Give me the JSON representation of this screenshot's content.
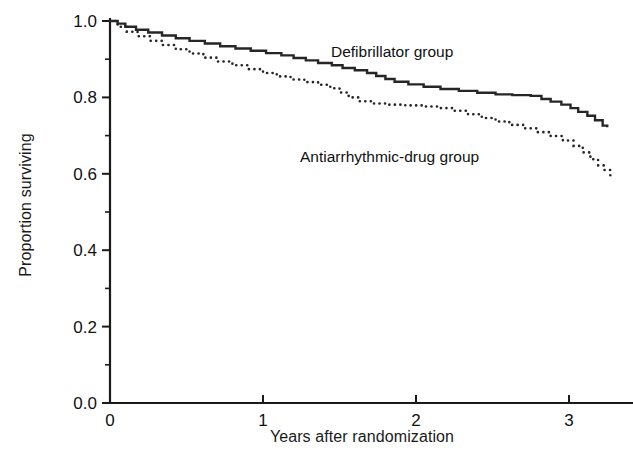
{
  "chart_data": {
    "type": "line",
    "title": "",
    "subtitle": "",
    "xlabel": "Years after randomization",
    "ylabel": "Proportion surviving",
    "xlim": [
      0,
      3.42
    ],
    "ylim": [
      0.0,
      1.0
    ],
    "xticks": [
      0,
      1,
      2,
      3
    ],
    "xticklabels": [
      "0",
      "1",
      "2",
      "3"
    ],
    "yticks": [
      0.0,
      0.2,
      0.4,
      0.6,
      0.8,
      1.0
    ],
    "yticklabels": [
      "0.0",
      "0.2",
      "0.4",
      "0.6",
      "0.8",
      "1.0"
    ],
    "y_minor_ticks": [
      0.1,
      0.3,
      0.5,
      0.7,
      0.9
    ],
    "grid": false,
    "legend_position": "inline-annotations",
    "series": [
      {
        "name": "Defibrillator group",
        "style": "solid",
        "color": "#262626",
        "linewidth": 2.4,
        "annotation": "Defibrillator group",
        "points": [
          [
            0.0,
            1.0
          ],
          [
            0.05,
            0.993
          ],
          [
            0.1,
            0.985
          ],
          [
            0.17,
            0.977
          ],
          [
            0.25,
            0.97
          ],
          [
            0.34,
            0.962
          ],
          [
            0.43,
            0.955
          ],
          [
            0.52,
            0.948
          ],
          [
            0.62,
            0.941
          ],
          [
            0.72,
            0.934
          ],
          [
            0.82,
            0.928
          ],
          [
            0.92,
            0.922
          ],
          [
            1.02,
            0.916
          ],
          [
            1.12,
            0.91
          ],
          [
            1.2,
            0.903
          ],
          [
            1.28,
            0.897
          ],
          [
            1.36,
            0.89
          ],
          [
            1.45,
            0.884
          ],
          [
            1.52,
            0.877
          ],
          [
            1.6,
            0.871
          ],
          [
            1.68,
            0.864
          ],
          [
            1.74,
            0.856
          ],
          [
            1.8,
            0.848
          ],
          [
            1.86,
            0.841
          ],
          [
            1.95,
            0.834
          ],
          [
            2.05,
            0.828
          ],
          [
            2.16,
            0.822
          ],
          [
            2.28,
            0.817
          ],
          [
            2.4,
            0.812
          ],
          [
            2.52,
            0.808
          ],
          [
            2.63,
            0.806
          ],
          [
            2.75,
            0.804
          ],
          [
            2.82,
            0.796
          ],
          [
            2.88,
            0.789
          ],
          [
            2.95,
            0.781
          ],
          [
            3.01,
            0.772
          ],
          [
            3.06,
            0.762
          ],
          [
            3.12,
            0.752
          ],
          [
            3.17,
            0.74
          ],
          [
            3.22,
            0.726
          ],
          [
            3.25,
            0.722
          ]
        ]
      },
      {
        "name": "Antiarrhythmic-drug group",
        "style": "dotted",
        "color": "#262626",
        "linewidth": 2.6,
        "annotation": "Antiarrhythmic-drug group",
        "points": [
          [
            0.0,
            1.0
          ],
          [
            0.05,
            0.985
          ],
          [
            0.11,
            0.972
          ],
          [
            0.18,
            0.96
          ],
          [
            0.26,
            0.948
          ],
          [
            0.34,
            0.937
          ],
          [
            0.43,
            0.926
          ],
          [
            0.52,
            0.915
          ],
          [
            0.61,
            0.904
          ],
          [
            0.7,
            0.894
          ],
          [
            0.8,
            0.884
          ],
          [
            0.9,
            0.874
          ],
          [
            1.0,
            0.864
          ],
          [
            1.09,
            0.855
          ],
          [
            1.18,
            0.847
          ],
          [
            1.27,
            0.84
          ],
          [
            1.36,
            0.833
          ],
          [
            1.44,
            0.824
          ],
          [
            1.5,
            0.813
          ],
          [
            1.56,
            0.8
          ],
          [
            1.63,
            0.79
          ],
          [
            1.72,
            0.784
          ],
          [
            1.82,
            0.781
          ],
          [
            1.93,
            0.779
          ],
          [
            2.04,
            0.776
          ],
          [
            2.15,
            0.772
          ],
          [
            2.25,
            0.765
          ],
          [
            2.34,
            0.756
          ],
          [
            2.43,
            0.746
          ],
          [
            2.52,
            0.737
          ],
          [
            2.61,
            0.728
          ],
          [
            2.7,
            0.719
          ],
          [
            2.79,
            0.709
          ],
          [
            2.88,
            0.699
          ],
          [
            2.96,
            0.687
          ],
          [
            3.03,
            0.673
          ],
          [
            3.09,
            0.656
          ],
          [
            3.14,
            0.638
          ],
          [
            3.19,
            0.622
          ],
          [
            3.23,
            0.61
          ],
          [
            3.27,
            0.585
          ]
        ]
      }
    ]
  },
  "axes": {
    "x_label": "Years after randomization",
    "y_label": "Proportion surviving",
    "x_tick_labels": [
      "0",
      "1",
      "2",
      "3"
    ],
    "y_tick_labels": [
      "0.0",
      "0.2",
      "0.4",
      "0.6",
      "0.8",
      "1.0"
    ]
  },
  "annotations": {
    "defibrillator": "Defibrillator group",
    "antiarrhythmic": "Antiarrhythmic-drug group"
  },
  "colors": {
    "background": "#ffffff",
    "axis": "#1a1a1a",
    "curve": "#262626",
    "text": "#111111"
  }
}
